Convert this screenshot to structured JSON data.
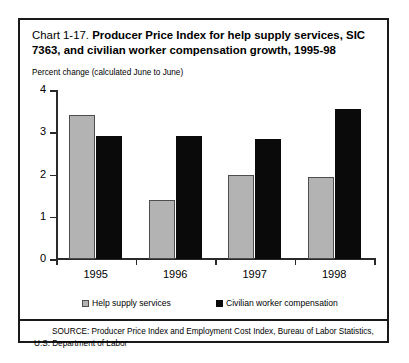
{
  "chart_data": {
    "type": "bar",
    "title": "Chart 1-17. Producer Price Index for help supply services, SIC 7363, and civilian worker compensation growth, 1995-98",
    "title_lead": "Chart 1-17.",
    "title_bold_line1": "Producer Price Index for help supply services,",
    "title_bold_line2": "SIC 7363, and civilian worker compensation growth, 1995-98",
    "subtitle": "Percent change (calculated June to June)",
    "xlabel": "",
    "ylabel": "Percent change",
    "ylim": [
      0,
      4
    ],
    "yticks": [
      0,
      1,
      2,
      3,
      4
    ],
    "ytick_labels": [
      "0",
      "1",
      "2",
      "3",
      "4"
    ],
    "grid": false,
    "legend_position": "bottom",
    "categories": [
      "1995",
      "1996",
      "1997",
      "1998"
    ],
    "series": [
      {
        "name": "Help supply services",
        "color": "#b3b3b3",
        "values": [
          3.4,
          1.4,
          2.0,
          1.95
        ]
      },
      {
        "name": "Civilian worker compensation",
        "color": "#0a0a0a",
        "values": [
          2.9,
          2.9,
          2.85,
          3.55
        ]
      }
    ],
    "source_note": "SOURCE: Producer Price Index and Employment Cost Index, Bureau of Labor Statistics, U.S. Department of Labor"
  }
}
